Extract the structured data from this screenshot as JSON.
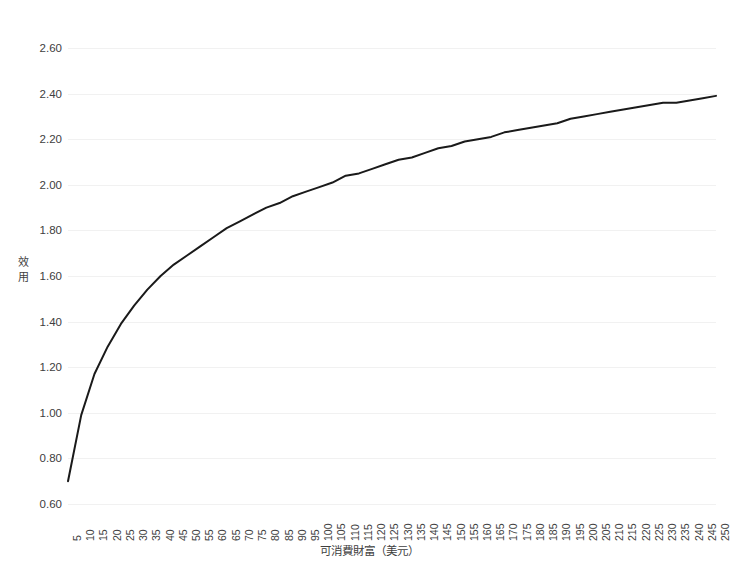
{
  "chart_data": {
    "type": "line",
    "title": "",
    "xlabel": "可消費財富（美元）",
    "ylabel": "效用",
    "xlim": [
      5,
      250
    ],
    "ylim": [
      0.6,
      2.6
    ],
    "grid": true,
    "legend": null,
    "series_name": "效用曲線",
    "line_color": "#1a1a1a",
    "grid_color": "#f1f1f1",
    "x": [
      5,
      10,
      15,
      20,
      25,
      30,
      35,
      40,
      45,
      50,
      55,
      60,
      65,
      70,
      75,
      80,
      85,
      90,
      95,
      100,
      105,
      110,
      115,
      120,
      125,
      130,
      135,
      140,
      145,
      150,
      155,
      160,
      165,
      170,
      175,
      180,
      185,
      190,
      195,
      200,
      205,
      210,
      215,
      220,
      225,
      230,
      235,
      240,
      245,
      250
    ],
    "values": [
      0.7,
      0.99,
      1.17,
      1.29,
      1.39,
      1.47,
      1.54,
      1.6,
      1.65,
      1.69,
      1.73,
      1.77,
      1.81,
      1.84,
      1.87,
      1.9,
      1.92,
      1.95,
      1.97,
      1.99,
      2.01,
      2.04,
      2.05,
      2.07,
      2.09,
      2.11,
      2.12,
      2.14,
      2.16,
      2.17,
      2.19,
      2.2,
      2.21,
      2.23,
      2.24,
      2.25,
      2.26,
      2.27,
      2.29,
      2.3,
      2.31,
      2.32,
      2.33,
      2.34,
      2.35,
      2.36,
      2.36,
      2.37,
      2.38,
      2.39
    ],
    "ytick_labels": [
      "0.60",
      "0.80",
      "1.00",
      "1.20",
      "1.40",
      "1.60",
      "1.80",
      "2.00",
      "2.20",
      "2.40",
      "2.60"
    ],
    "ytick_values": [
      0.6,
      0.8,
      1.0,
      1.2,
      1.4,
      1.6,
      1.8,
      2.0,
      2.2,
      2.4,
      2.6
    ],
    "xtick_labels": [
      "5",
      "10",
      "15",
      "20",
      "25",
      "30",
      "35",
      "40",
      "45",
      "50",
      "55",
      "60",
      "65",
      "70",
      "75",
      "80",
      "85",
      "90",
      "95",
      "100",
      "105",
      "110",
      "115",
      "120",
      "125",
      "130",
      "135",
      "140",
      "145",
      "150",
      "155",
      "160",
      "165",
      "170",
      "175",
      "180",
      "185",
      "190",
      "195",
      "200",
      "205",
      "210",
      "215",
      "220",
      "225",
      "230",
      "235",
      "240",
      "245",
      "250"
    ]
  }
}
